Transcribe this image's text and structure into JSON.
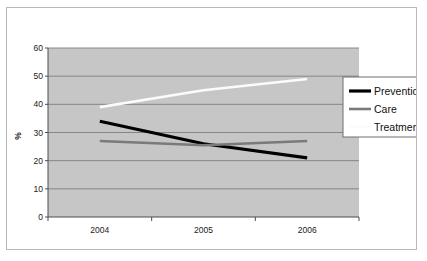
{
  "chart_data": {
    "type": "line",
    "title": "",
    "xlabel": "",
    "ylabel": "%",
    "categories": [
      "2004",
      "2005",
      "2006"
    ],
    "x_tick_labels": [
      "2004",
      "2005",
      "2006"
    ],
    "y_tick_labels": [
      "0",
      "10",
      "20",
      "30",
      "40",
      "50",
      "60"
    ],
    "y_tick_values": [
      0,
      10,
      20,
      30,
      40,
      50,
      60
    ],
    "ylim": [
      0,
      60
    ],
    "grid": true,
    "grid_orientation": "horizontal",
    "legend_position": "right",
    "plot_background": "#c6c6c6",
    "series": [
      {
        "name": "Prevention",
        "values": [
          34,
          26,
          21
        ],
        "color": "#000000",
        "width": 3.2
      },
      {
        "name": "Care",
        "values": [
          27,
          25.5,
          27
        ],
        "color": "#7a7a7a",
        "width": 2.6
      },
      {
        "name": "Treatment",
        "values": [
          39,
          45,
          49
        ],
        "color": "#fbfbfb",
        "width": 2.6
      }
    ]
  },
  "axes": {
    "y_title": "%",
    "y_ticks": [
      {
        "label": "60",
        "value": 60
      },
      {
        "label": "50",
        "value": 50
      },
      {
        "label": "40",
        "value": 40
      },
      {
        "label": "30",
        "value": 30
      },
      {
        "label": "20",
        "value": 20
      },
      {
        "label": "10",
        "value": 10
      },
      {
        "label": "0",
        "value": 0
      }
    ],
    "x_ticks": [
      {
        "label": "2004"
      },
      {
        "label": "2005"
      },
      {
        "label": "2006"
      }
    ]
  },
  "legend": {
    "items": [
      {
        "label": "Prevention",
        "color": "#000000"
      },
      {
        "label": "Care",
        "color": "#7a7a7a"
      },
      {
        "label": "Treatment",
        "color": "#fbfbfb"
      }
    ]
  },
  "colors": {
    "plot_area": "#c6c6c6",
    "gridline": "#7f7f7f",
    "axis": "#555555",
    "frame_border": "#b9b9b9",
    "legend_border": "#6e6e6e",
    "page_background": "#ffffff"
  }
}
